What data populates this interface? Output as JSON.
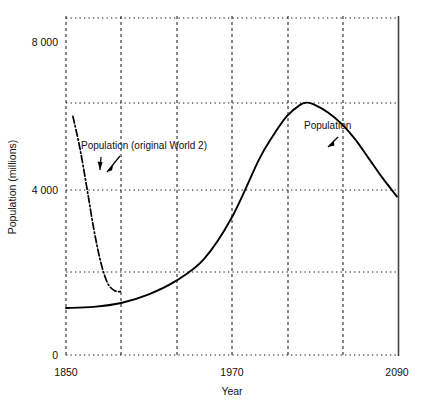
{
  "chart_data": {
    "type": "line",
    "title": "",
    "xlabel": "Year",
    "ylabel": "Population (millions)",
    "xlim": [
      1850,
      2090
    ],
    "ylim": [
      0,
      8500
    ],
    "xticks": [
      1850,
      1970,
      2090
    ],
    "xtick_labels": [
      "1850",
      "1970",
      "2090"
    ],
    "yticks": [
      0,
      4000,
      8000
    ],
    "ytick_labels": [
      "0",
      "4 000",
      "8 000"
    ],
    "grid": "dotted horizontal every 2000, dashed vertical every 40 years",
    "legend_position": "inline annotations with arrows",
    "annotations": [
      {
        "text": "Population (original World 2)",
        "x": 1880,
        "y": 5250,
        "points_to": [
          1862,
          4300
        ]
      },
      {
        "text": "Population",
        "x": 2027,
        "y": 6500,
        "points_to": [
          2040,
          5900
        ]
      }
    ],
    "series": [
      {
        "name": "Population",
        "style": "solid line",
        "marker": "none",
        "x": [
          1850,
          1870,
          1890,
          1910,
          1930,
          1950,
          1970,
          1990,
          2000,
          2010,
          2020,
          2025,
          2030,
          2040,
          2050,
          2060,
          2070,
          2080,
          2090
        ],
        "values": [
          1200,
          1230,
          1330,
          1550,
          1900,
          2450,
          3500,
          5000,
          5600,
          6100,
          6400,
          6450,
          6400,
          6200,
          5900,
          5500,
          5000,
          4500,
          4050
        ]
      },
      {
        "name": "Population (original World 2)",
        "style": "dash-dot line",
        "marker": "none",
        "x": [
          1855,
          1860,
          1865,
          1870,
          1875,
          1880,
          1885,
          1890
        ],
        "values": [
          6100,
          5300,
          4300,
          3250,
          2400,
          1850,
          1650,
          1620
        ]
      },
      {
        "name": "Resources",
        "style": "dotted marker trace",
        "marker": "z",
        "x": [
          1850,
          1870,
          1890,
          1910,
          1930,
          1950,
          1970,
          1990,
          2000,
          2010,
          2020,
          2030,
          2040,
          2050,
          2060,
          2070,
          2080,
          2090
        ],
        "values": [
          8000,
          8000,
          7950,
          7700,
          7300,
          6700,
          5900,
          4900,
          4350,
          3800,
          3300,
          2900,
          2600,
          2450,
          2350,
          2280,
          2230,
          2200
        ]
      },
      {
        "name": "Industrial output per capita",
        "style": "dotted marker trace",
        "marker": "o",
        "x": [
          1850,
          1870,
          1890,
          1910,
          1930,
          1950,
          1965,
          1975,
          1985,
          1995,
          2005,
          2015,
          2025,
          2035,
          2045,
          2055,
          2065,
          2075,
          2090
        ],
        "values": [
          1450,
          1900,
          2400,
          2950,
          3550,
          4100,
          4450,
          4400,
          4150,
          3750,
          3250,
          2750,
          2350,
          2100,
          2000,
          2000,
          2050,
          2050,
          1950
        ]
      },
      {
        "name": "Food per capita",
        "style": "dotted marker trace",
        "marker": "c",
        "x": [
          1880,
          1900,
          1920,
          1940,
          1960,
          1980,
          1995,
          2005,
          2015,
          2025,
          2035,
          2045,
          2055,
          2065,
          2075,
          2090
        ],
        "values": [
          50,
          180,
          380,
          650,
          1000,
          1450,
          1900,
          2200,
          2500,
          2750,
          2900,
          2950,
          2850,
          2650,
          2400,
          2150
        ]
      },
      {
        "name": "Pollution",
        "style": "dotted marker trace",
        "marker": "N",
        "x": [
          1850,
          1900,
          1940,
          1970,
          1990,
          2005,
          2020,
          2035,
          2045,
          2055,
          2065,
          2075,
          2090
        ],
        "values": [
          20,
          30,
          60,
          120,
          260,
          450,
          750,
          1050,
          1200,
          1250,
          1200,
          1050,
          850
        ]
      }
    ]
  }
}
